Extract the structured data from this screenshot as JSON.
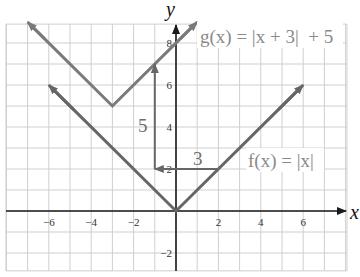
{
  "chart_data": {
    "type": "line",
    "title": "",
    "xlabel": "x",
    "ylabel": "y",
    "xlim": [
      -8,
      8
    ],
    "ylim": [
      -3,
      9
    ],
    "grid": true,
    "x_ticks": [
      -6,
      -4,
      -2,
      2,
      4,
      6
    ],
    "y_ticks": [
      -2,
      2,
      4,
      6,
      8
    ],
    "x_tick_labels": [
      "−6",
      "−4",
      "−2",
      "2",
      "4",
      "6"
    ],
    "y_tick_labels": [
      "−2",
      "2",
      "4",
      "6",
      "8"
    ],
    "series": [
      {
        "name": "f(x) = |x|",
        "label": "f(x) = |x|",
        "points": [
          [
            -6,
            6
          ],
          [
            0,
            0
          ],
          [
            6,
            6
          ]
        ],
        "color": "#666666"
      },
      {
        "name": "g(x) = |x + 3| + 5",
        "label": "g(x) = |x + 3| + 5",
        "points": [
          [
            -7,
            9
          ],
          [
            -3,
            5
          ],
          [
            1,
            9
          ]
        ],
        "color": "#7a7a7a"
      }
    ],
    "annotations": [
      {
        "type": "arrow",
        "from": [
          2,
          2
        ],
        "to": [
          -1,
          2
        ],
        "label": "3",
        "meaning": "horizontal shift left 3"
      },
      {
        "type": "arrow",
        "from": [
          -1,
          2
        ],
        "to": [
          -1,
          7
        ],
        "label": "5",
        "meaning": "vertical shift up 5"
      }
    ]
  },
  "labels": {
    "x_axis": "x",
    "y_axis": "y",
    "f_label": "f(x) = |x|",
    "g_label": "g(x) = |x + 3|  + 5",
    "shift_h": "3",
    "shift_v": "5"
  },
  "colors": {
    "grid": "#cfcfcf",
    "axis": "#1a1a1a",
    "f_line": "#666666",
    "g_line": "#7a7a7a",
    "label_text": "#8a8a8a"
  }
}
